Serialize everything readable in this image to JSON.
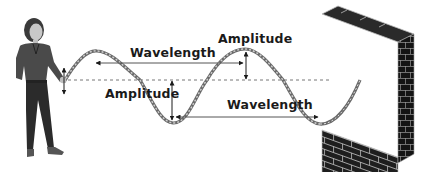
{
  "diagram": {
    "title": "",
    "labels": {
      "wavelength_top": "Wavelength",
      "amplitude_top": "Amplitude",
      "amplitude_left": "Amplitude",
      "wavelength_bottom": "Wavelength"
    },
    "elements": {
      "person": "person-holding-rope",
      "rope": "wave-rope",
      "midline": "equilibrium-dashed-line",
      "wall": "brick-wall"
    },
    "colors": {
      "ink": "#1a1a1a",
      "rope": "#8a8a8a",
      "midline": "#777777",
      "wall": "#1e1e1e",
      "mortar": "#bdbdbd",
      "clothes": "#444444",
      "pants": "#2b2b2b",
      "skin": "#bfbfbf"
    }
  }
}
